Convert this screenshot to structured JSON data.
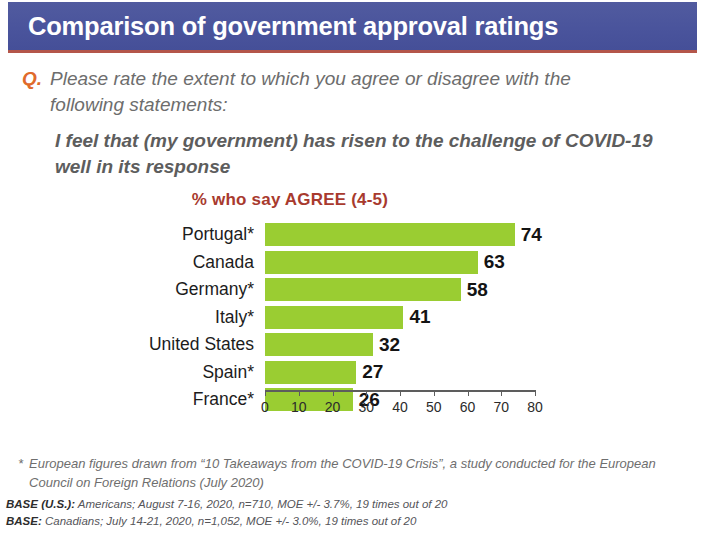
{
  "header": {
    "title": "Comparison of government approval ratings",
    "banner_color": "#4a549c",
    "underline_color": "#b4564a"
  },
  "question": {
    "marker": "Q.",
    "marker_color": "#e06a2b",
    "text": "Please rate the extent to which you agree or disagree with the following statements:",
    "statement": "I feel that (my government) has risen to the challenge of COVID-19 well in its response"
  },
  "chart_data": {
    "type": "bar",
    "orientation": "horizontal",
    "title": "% who say AGREE (4-5)",
    "title_color": "#a83a2e",
    "bar_color": "#9acd32",
    "categories": [
      "Portugal*",
      "Canada",
      "Germany*",
      "Italy*",
      "United States",
      "Spain*",
      "France*"
    ],
    "values": [
      74,
      63,
      58,
      41,
      32,
      27,
      26
    ],
    "xlabel": "",
    "ylabel": "",
    "xlim": [
      0,
      80
    ],
    "xticks": [
      0,
      10,
      20,
      30,
      40,
      50,
      60,
      70,
      80
    ],
    "xtick_labels": [
      "0",
      "10",
      "20",
      "30",
      "40",
      "50",
      "60",
      "70",
      "80"
    ],
    "grid": false,
    "legend": null,
    "data_labels": [
      "74",
      "63",
      "58",
      "41",
      "32",
      "27",
      "26"
    ]
  },
  "footnote": {
    "star": "*",
    "text": "European figures drawn from “10 Takeaways from the COVID-19 Crisis”, a study conducted for the European Council on Foreign Relations (July 2020)"
  },
  "base_notes": [
    {
      "label": "BASE (U.S.):",
      "text": "Americans; August 7-16, 2020, n=710, MOE +/- 3.7%, 19 times out of 20"
    },
    {
      "label": "BASE:",
      "text": "Canadians; July 14-21, 2020, n=1,052, MOE +/- 3.0%, 19 times out of 20"
    }
  ]
}
